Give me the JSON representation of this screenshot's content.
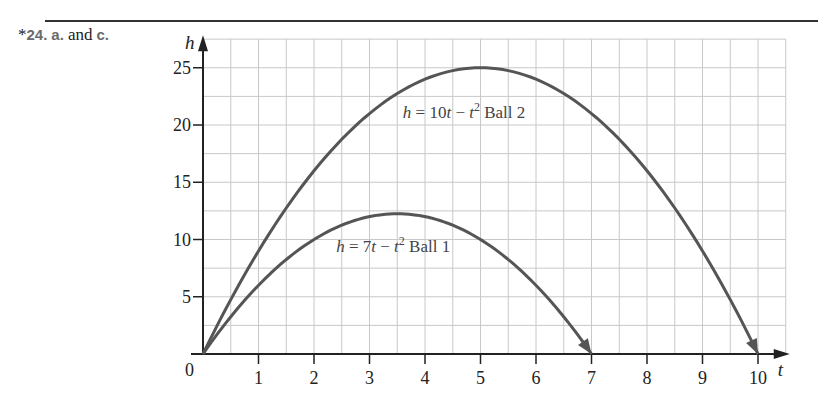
{
  "header": {
    "problem_prefix": "*",
    "problem_number": "24.",
    "part_a": "a.",
    "and_text": "and",
    "part_c": "c."
  },
  "chart_data": {
    "type": "line",
    "title": "",
    "xlabel": "t",
    "ylabel": "h",
    "xlim": [
      0,
      10.5
    ],
    "ylim": [
      0,
      27.5
    ],
    "grid": true,
    "grid_step_x": 0.5,
    "grid_step_y": 2.5,
    "x_ticks": [
      1,
      2,
      3,
      4,
      5,
      6,
      7,
      8,
      9,
      10
    ],
    "y_ticks": [
      5,
      10,
      15,
      20,
      25
    ],
    "origin_label": "0",
    "series": [
      {
        "name": "Ball 1",
        "equation": "h = 7t − t²",
        "annotation": {
          "prefix": "h = 7t − t",
          "sup": "2",
          "suffix": " Ball 1",
          "t": 2.4,
          "h": 8.9
        },
        "a": 7,
        "t_range": [
          0,
          7
        ],
        "x": [
          0,
          0.5,
          1,
          1.5,
          2,
          2.5,
          3,
          3.5,
          4,
          4.5,
          5,
          5.5,
          6,
          6.5,
          7
        ],
        "values": [
          0,
          3.25,
          6,
          8.25,
          10,
          11.25,
          12,
          12.25,
          12,
          11.25,
          10,
          8.25,
          6,
          3.25,
          0
        ]
      },
      {
        "name": "Ball 2",
        "equation": "h = 10t − t²",
        "annotation": {
          "prefix": "h = 10t − t",
          "sup": "2",
          "suffix": " Ball 2",
          "t": 3.6,
          "h": 20.6
        },
        "a": 10,
        "t_range": [
          0,
          10
        ],
        "x": [
          0,
          1,
          2,
          3,
          4,
          5,
          6,
          7,
          8,
          9,
          10
        ],
        "values": [
          0,
          9,
          16,
          21,
          24,
          25,
          24,
          21,
          16,
          9,
          0
        ]
      }
    ]
  },
  "colors": {
    "curve": "#555555",
    "axis": "#222222",
    "grid": "#c8c8c8",
    "rule": "#333333"
  }
}
